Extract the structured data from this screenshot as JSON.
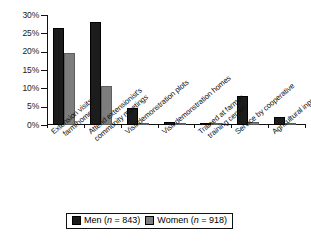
{
  "chart_data": {
    "type": "bar",
    "title": "",
    "subtitle": "",
    "xlabel": "",
    "ylabel": "",
    "ylim": [
      0,
      30
    ],
    "ytick_labels": [
      "0%",
      "5%",
      "10%",
      "15%",
      "20%",
      "25%",
      "30%"
    ],
    "ytick_values": [
      0,
      5,
      10,
      15,
      20,
      25,
      30
    ],
    "grid": false,
    "legend_position": "bottom",
    "categories": [
      "Extension visits farm/home",
      "Attend extensionist's community meetings",
      "Visit demonstration plots",
      "Visit demonstration homes",
      "Trained at farmer training center",
      "Service by cooperative",
      "Agricultural input credit"
    ],
    "category_lines": [
      [
        "Extension visits",
        "farm/home"
      ],
      [
        "Attend extensionist's",
        "community meetings"
      ],
      [
        "Visit demonstration plots",
        ""
      ],
      [
        "Visit demonstration homes",
        ""
      ],
      [
        "Trained at farmer",
        "training center"
      ],
      [
        "Service by cooperative",
        ""
      ],
      [
        "Agricultural input credit",
        ""
      ]
    ],
    "series": [
      {
        "name": "Men (n = 843)",
        "color": "#1c1c1c",
        "values": [
          26.5,
          28.0,
          4.7,
          0.8,
          0.5,
          7.8,
          2.2
        ]
      },
      {
        "name": "Women (n = 918)",
        "color": "#7d7d7d",
        "values": [
          19.7,
          10.7,
          0.6,
          0.2,
          0.15,
          0.8,
          0.15
        ]
      }
    ]
  },
  "legend": {
    "men": {
      "label_prefix": "Men (",
      "n_symbol": "n",
      "n_eq": " = 843)"
    },
    "women": {
      "label_prefix": "Women (",
      "n_symbol": "n",
      "n_eq": " = 918)"
    }
  }
}
